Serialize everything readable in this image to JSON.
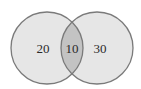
{
  "diagram": {
    "type": "venn",
    "sets": [
      {
        "name": "left-set",
        "only_count": "20"
      },
      {
        "name": "right-set",
        "only_count": "30"
      }
    ],
    "intersection_count": "10"
  },
  "colors": {
    "background": "#ffffff",
    "circle_fill": "#e6e6e6",
    "overlap_fill": "#c3c3c3",
    "stroke": "#7a7a7a",
    "text": "#2a2a2a"
  }
}
